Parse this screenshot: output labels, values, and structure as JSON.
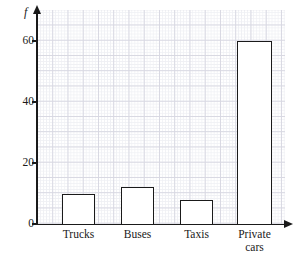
{
  "chart_data": {
    "type": "bar",
    "title": "",
    "xlabel": "",
    "ylabel": "f",
    "categories": [
      "Trucks",
      "Buses",
      "Taxis",
      "Private\ncars"
    ],
    "values": [
      10,
      12,
      8,
      60
    ],
    "ylim": [
      0,
      70
    ],
    "yticks": [
      0,
      20,
      40,
      60
    ],
    "ytick_labels": [
      "0",
      "20",
      "40",
      "60"
    ],
    "grid": true,
    "grid_minor": true,
    "legend": "none",
    "bar_style": {
      "fill_color": "#ffffff",
      "edge_color": "#1a1a1a"
    },
    "axis_color": "#1a1a1a",
    "grid_color_minor": "#eff0f4",
    "grid_color_major": "#d8d8e2"
  }
}
